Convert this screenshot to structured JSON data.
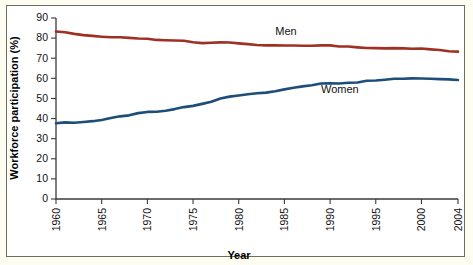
{
  "chart_data": {
    "type": "line",
    "title": "",
    "xlabel": "Year",
    "ylabel": "Workforce participation (%)",
    "xlim": [
      1960,
      2004
    ],
    "ylim": [
      0,
      90
    ],
    "grid": false,
    "legend_position": "inline-annotations",
    "x_tick_labels": [
      "1960",
      "1965",
      "1970",
      "1975",
      "1980",
      "1985",
      "1990",
      "1995",
      "2000",
      "2004"
    ],
    "x_tick_values": [
      1960,
      1965,
      1970,
      1975,
      1980,
      1985,
      1990,
      1995,
      2000,
      2004
    ],
    "y_tick_labels": [
      "0",
      "10",
      "20",
      "30",
      "40",
      "50",
      "60",
      "70",
      "80",
      "90"
    ],
    "y_tick_values": [
      0,
      10,
      20,
      30,
      40,
      50,
      60,
      70,
      80,
      90
    ],
    "x": [
      1960,
      1961,
      1962,
      1963,
      1964,
      1965,
      1966,
      1967,
      1968,
      1969,
      1970,
      1971,
      1972,
      1973,
      1974,
      1975,
      1976,
      1977,
      1978,
      1979,
      1980,
      1981,
      1982,
      1983,
      1984,
      1985,
      1986,
      1987,
      1988,
      1989,
      1990,
      1991,
      1992,
      1993,
      1994,
      1995,
      1996,
      1997,
      1998,
      1999,
      2000,
      2001,
      2002,
      2003,
      2004
    ],
    "series": [
      {
        "name": "Men",
        "color": "#9e3024",
        "label_text": "Men",
        "values": [
          83.3,
          82.9,
          82.1,
          81.5,
          81.1,
          80.7,
          80.4,
          80.4,
          80.1,
          79.8,
          79.7,
          79.1,
          78.9,
          78.8,
          78.7,
          77.9,
          77.5,
          77.7,
          77.9,
          77.8,
          77.4,
          77.0,
          76.6,
          76.4,
          76.4,
          76.3,
          76.3,
          76.2,
          76.2,
          76.4,
          76.4,
          75.8,
          75.8,
          75.4,
          75.1,
          75.0,
          74.9,
          75.0,
          74.9,
          74.7,
          74.8,
          74.4,
          74.1,
          73.5,
          73.3
        ]
      },
      {
        "name": "Women",
        "color": "#1d4e79",
        "label_text": "Women",
        "values": [
          37.7,
          38.1,
          37.9,
          38.3,
          38.7,
          39.3,
          40.3,
          41.1,
          41.6,
          42.7,
          43.3,
          43.4,
          43.9,
          44.7,
          45.7,
          46.3,
          47.3,
          48.4,
          50.0,
          50.9,
          51.5,
          52.1,
          52.6,
          52.9,
          53.6,
          54.5,
          55.3,
          56.0,
          56.6,
          57.4,
          57.5,
          57.4,
          57.8,
          57.9,
          58.8,
          58.9,
          59.3,
          59.8,
          59.8,
          60.0,
          59.9,
          59.8,
          59.6,
          59.5,
          59.2
        ]
      }
    ]
  },
  "axes": {
    "x_axis_title": "Year",
    "y_axis_title": "Workforce participation (%)"
  }
}
